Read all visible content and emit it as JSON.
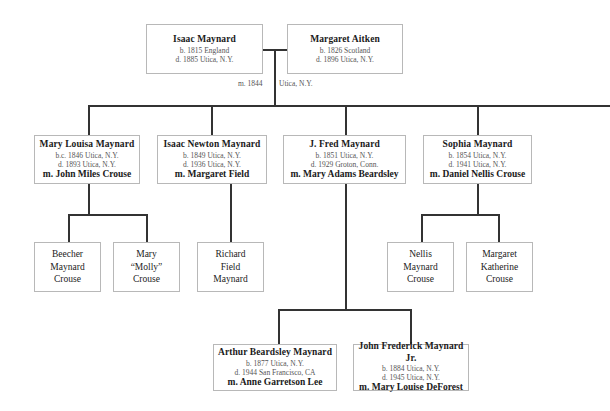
{
  "root_couple": {
    "husband": {
      "name": "Isaac Maynard",
      "born": "b. 1815 England",
      "died": "d. 1885 Utica, N.Y."
    },
    "wife": {
      "name": "Margaret Aitken",
      "born": "b. 1826 Scotland",
      "died": "d. 1896 Utica, N.Y."
    },
    "marriage_year": "m. 1844",
    "marriage_place": "Utica, N.Y."
  },
  "children": [
    {
      "name": "Mary Louisa Maynard",
      "born": "b.c. 1846 Utica, N.Y.",
      "died": "d. 1893 Utica, N.Y.",
      "spouse": "m. John Miles Crouse",
      "children": [
        {
          "name": "Beecher\nMaynard\nCrouse"
        },
        {
          "name": "Mary\n“Molly”\nCrouse"
        }
      ]
    },
    {
      "name": "Isaac Newton Maynard",
      "born": "b. 1849 Utica, N.Y.",
      "died": "d. 1936 Utica, N.Y.",
      "spouse": "m. Margaret Field",
      "children": [
        {
          "name": "Richard\nField\nMaynard"
        }
      ]
    },
    {
      "name": "J. Fred Maynard",
      "born": "b. 1851 Utica, N.Y.",
      "died": "d. 1929 Groton, Conn.",
      "spouse": "m. Mary Adams Beardsley",
      "children": [
        {
          "name": "Arthur Beardsley Maynard",
          "born": "b. 1877 Utica, N.Y.",
          "died": "d. 1944 San Francisco, CA",
          "spouse": "m. Anne Garretson Lee"
        },
        {
          "name": "John Frederick Maynard Jr.",
          "born": "b. 1884 Utica, N.Y.",
          "died": "d. 1945 Utica, N.Y.",
          "spouse": "m. Mary Louise DeForest"
        }
      ]
    },
    {
      "name": "Sophia Maynard",
      "born": "b. 1854 Utica, N.Y.",
      "died": "d. 1941 Utica, N.Y.",
      "spouse": "m. Daniel Nellis Crouse",
      "children": [
        {
          "name": "Nellis\nMaynard\nCrouse"
        },
        {
          "name": "Margaret\nKatherine\nCrouse"
        }
      ]
    }
  ],
  "colors": {
    "line": "#333333",
    "border": "#b8b8b8",
    "meta_text": "#555555"
  }
}
